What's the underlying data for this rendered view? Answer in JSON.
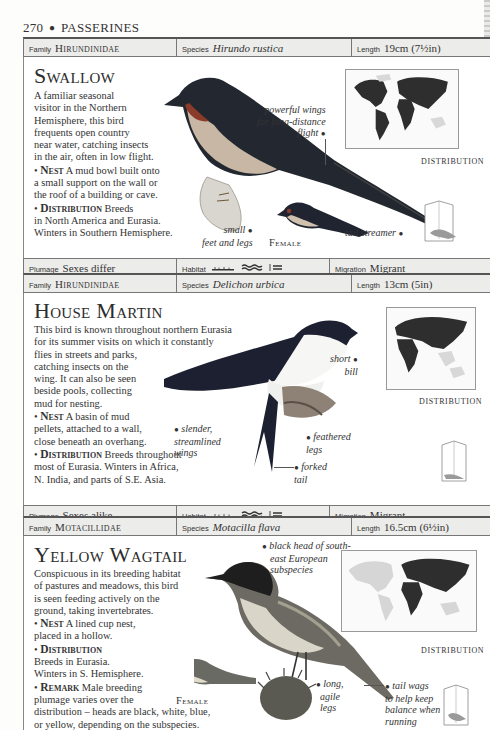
{
  "page": {
    "number": "270",
    "section": "PASSERINES"
  },
  "labels": {
    "family": "Family",
    "species": "Species",
    "length": "Length",
    "plumage": "Plumage",
    "habitat": "Habitat",
    "migration": "Migration",
    "distribution_map": "DISTRIBUTION",
    "female": "Female"
  },
  "entries": [
    {
      "family": "Hirundinidae",
      "species": "Hirundo rustica",
      "length": "19cm (7½in)",
      "common_name": "Swallow",
      "description": "A familiar seasonal visitor in the Northern Hemisphere, this bird frequents open country near water, catching insects in the air, often in low flight.",
      "description_lines": [
        "A familiar seasonal",
        "visitor in the Northern",
        "Hemisphere, this bird",
        "frequents open country",
        "near water, catching insects",
        "in the air, often in low flight."
      ],
      "nest_heading": "Nest",
      "nest_lines": [
        "A mud bowl built onto",
        "a small support on the wall or",
        "the roof of a building or cave."
      ],
      "distribution_heading": "Distribution",
      "distribution_lines": [
        "Breeds",
        "in North America and Eurasia.",
        "Winters in Southern Hemisphere."
      ],
      "callouts": {
        "wings": "powerful wings for long-distance flight",
        "wings_lines": [
          "powerful wings",
          "for long-distance",
          "flight"
        ],
        "feet_lines": [
          "small",
          "feet and legs"
        ],
        "tail": "tail streamer"
      },
      "plumage": "Sexes differ",
      "habitat_icons": [
        "grassland-icon",
        "wetland-icon",
        "freshwater-icon"
      ],
      "migration": "Migrant"
    },
    {
      "family": "Hirundinidae",
      "species": "Delichon urbica",
      "length": "13cm (5in)",
      "common_name": "House Martin",
      "description_lines": [
        "This bird is known throughout northern Eurasia",
        "for its summer visits on which it constantly",
        "flies in streets and parks,",
        "catching insects on the",
        "wing. It can also be seen",
        "beside pools, collecting",
        "mud for nesting."
      ],
      "nest_heading": "Nest",
      "nest_lines": [
        "A basin of mud",
        "pellets, attached to a wall,",
        "close beneath an overhang."
      ],
      "distribution_heading": "Distribution",
      "distribution_lines": [
        "Breeds throughout",
        "most of Eurasia. Winters in Africa,",
        "N. India, and parts of S.E. Asia."
      ],
      "callouts": {
        "wings_lines": [
          "slender,",
          "streamlined",
          "wings"
        ],
        "bill_lines": [
          "short",
          "bill"
        ],
        "legs_lines": [
          "feathered",
          "legs"
        ],
        "tail_lines": [
          "forked",
          "tail"
        ]
      },
      "plumage": "Sexes alike",
      "habitat_icons": [
        "grassland-icon",
        "wetland-icon",
        "freshwater-icon"
      ],
      "migration": "Migrant"
    },
    {
      "family": "Motacillidae",
      "species": "Motacilla flava",
      "length": "16.5cm (6½in)",
      "common_name": "Yellow Wagtail",
      "description_lines": [
        "Conspicuous in its breeding habitat",
        "of pastures and meadows, this bird",
        "is seen feeding actively on the",
        "ground, taking invertebrates."
      ],
      "nest_heading": "Nest",
      "nest_lines": [
        "A lined cup nest,",
        "placed in a hollow."
      ],
      "distribution_heading": "Distribution",
      "distribution_lines": [
        "Breeds in Eurasia.",
        "Winters in S. Hemisphere."
      ],
      "remark_heading": "Remark",
      "remark_lines": [
        "Male breeding",
        "plumage varies over the",
        "distribution – heads are black, white, blue,",
        "or yellow, depending on the subspecies."
      ],
      "callouts": {
        "head_lines": [
          "black head of south-",
          "east European",
          "subspecies"
        ],
        "legs_lines": [
          "long,",
          "agile",
          "legs"
        ],
        "tail_lines": [
          "tail wags",
          "to help keep",
          "balance when",
          "running"
        ]
      }
    }
  ]
}
